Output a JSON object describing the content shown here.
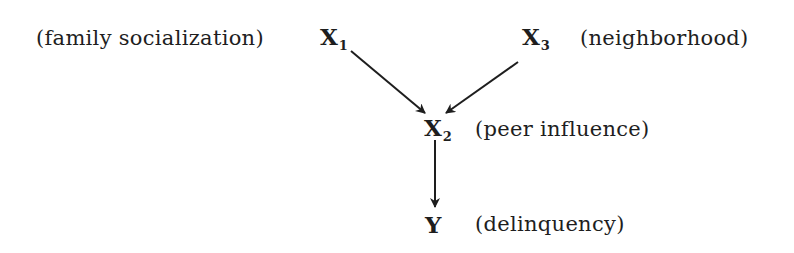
{
  "diagram": {
    "type": "causal-path-diagram",
    "nodes": [
      {
        "id": "X1",
        "symbol": "X",
        "subscript": "1",
        "label": "(family socialization)"
      },
      {
        "id": "X3",
        "symbol": "X",
        "subscript": "3",
        "label": "(neighborhood)"
      },
      {
        "id": "X2",
        "symbol": "X",
        "subscript": "2",
        "label": "(peer influence)"
      },
      {
        "id": "Y",
        "symbol": "Y",
        "subscript": "",
        "label": "(delinquency)"
      }
    ],
    "edges": [
      {
        "from": "X1",
        "to": "X2"
      },
      {
        "from": "X3",
        "to": "X2"
      },
      {
        "from": "X2",
        "to": "Y"
      }
    ]
  }
}
